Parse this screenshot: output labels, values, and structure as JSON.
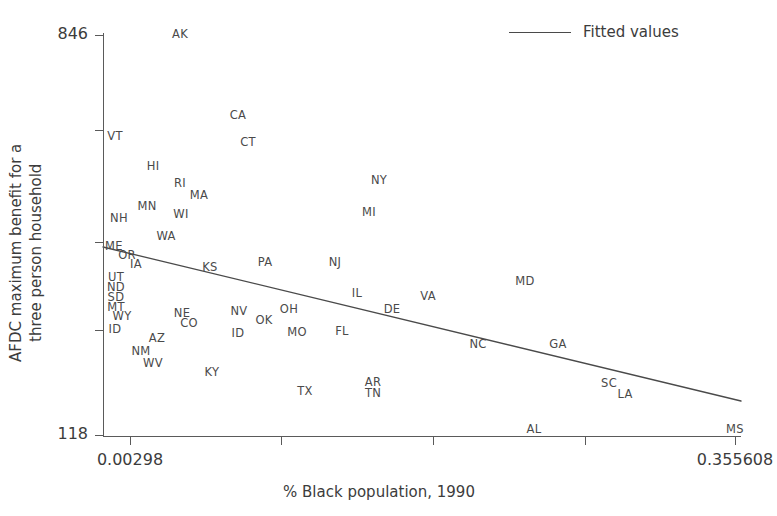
{
  "chart_data": {
    "type": "scatter",
    "title": "",
    "xlabel": "% Black population, 1990",
    "ylabel": "AFDC maximum benefit for a\nthree person household",
    "ylabel_line1": "AFDC maximum benefit for a",
    "ylabel_line2": "three person household",
    "xlim": [
      0.00298,
      0.355608
    ],
    "ylim": [
      118,
      846
    ],
    "xticks": [
      "0.00298",
      "",
      "",
      "",
      "0.355608"
    ],
    "xtick_values": [
      0.00298,
      0.09118,
      0.17929,
      0.2675,
      0.355608
    ],
    "yticks": [
      "846",
      "",
      "",
      "",
      "118"
    ],
    "ytick_values": [
      846,
      673,
      469,
      309,
      118
    ],
    "grid": false,
    "marker_style": "label-only",
    "legend": {
      "position": "top-right",
      "entries": [
        {
          "label": "Fitted values",
          "type": "line",
          "color": "#4a4a4a"
        }
      ]
    },
    "fit_line": {
      "label": "Fitted values",
      "color": "#4a4a4a",
      "x_start": 0.00298,
      "y_start": 493,
      "x_end": 0.355608,
      "y_end": 215
    },
    "point_labels": [
      "AK",
      "CA",
      "CT",
      "VT",
      "HI",
      "RI",
      "MA",
      "MN",
      "NH",
      "WI",
      "NY",
      "MI",
      "WA",
      "ME",
      "OR",
      "IA",
      "UT",
      "ND",
      "SD",
      "MT",
      "WY",
      "ID",
      "KS",
      "PA",
      "NJ",
      "MD",
      "IL",
      "VA",
      "DE",
      "NE",
      "CO",
      "NV",
      "OH",
      "OK",
      "MO",
      "FL",
      "NC",
      "GA",
      "AZ",
      "ID",
      "NM",
      "WV",
      "KY",
      "TX",
      "AR",
      "TN",
      "SC",
      "LA",
      "AL",
      "MS",
      "RI"
    ],
    "points": [
      {
        "label": "AK",
        "px": 180,
        "py": 35,
        "x": 0.0425,
        "y": 846
      },
      {
        "label": "CA",
        "px": 238,
        "py": 116,
        "x": 0.0749,
        "y": 701
      },
      {
        "label": "CT",
        "px": 248,
        "py": 143,
        "x": 0.0804,
        "y": 652
      },
      {
        "label": "VT",
        "px": 115,
        "py": 137,
        "x": 0.0065,
        "y": 663
      },
      {
        "label": "HI",
        "px": 153,
        "py": 167,
        "x": 0.0276,
        "y": 608
      },
      {
        "label": "RI",
        "px": 180,
        "py": 184,
        "x": 0.0427,
        "y": 578
      },
      {
        "label": "MA",
        "px": 199,
        "py": 196,
        "x": 0.0532,
        "y": 556
      },
      {
        "label": "MN",
        "px": 147,
        "py": 207,
        "x": 0.0243,
        "y": 536
      },
      {
        "label": "NH",
        "px": 119,
        "py": 219,
        "x": 0.0088,
        "y": 515
      },
      {
        "label": "WI",
        "px": 181,
        "py": 215,
        "x": 0.0433,
        "y": 522
      },
      {
        "label": "NY",
        "px": 379,
        "py": 181,
        "x": 0.1534,
        "y": 583
      },
      {
        "label": "MI",
        "px": 369,
        "py": 213,
        "x": 0.1478,
        "y": 526
      },
      {
        "label": "WA",
        "px": 166,
        "py": 237,
        "x": 0.0349,
        "y": 483
      },
      {
        "label": "ME",
        "px": 114,
        "py": 247,
        "x": 0.006,
        "y": 465
      },
      {
        "label": "OR",
        "px": 127,
        "py": 256,
        "x": 0.0132,
        "y": 449
      },
      {
        "label": "IA",
        "px": 136,
        "py": 265,
        "x": 0.0182,
        "y": 433
      },
      {
        "label": "UT",
        "px": 116,
        "py": 278,
        "x": 0.0071,
        "y": 409
      },
      {
        "label": "ND",
        "px": 116,
        "py": 288,
        "x": 0.0071,
        "y": 391
      },
      {
        "label": "SD",
        "px": 116,
        "py": 298,
        "x": 0.0071,
        "y": 373
      },
      {
        "label": "MT",
        "px": 116,
        "py": 308,
        "x": 0.0071,
        "y": 355
      },
      {
        "label": "WY",
        "px": 122,
        "py": 317,
        "x": 0.0104,
        "y": 338
      },
      {
        "label": "ID",
        "px": 115,
        "py": 330,
        "x": 0.0065,
        "y": 315
      },
      {
        "label": "KS",
        "px": 210,
        "py": 268,
        "x": 0.0593,
        "y": 427
      },
      {
        "label": "PA",
        "px": 265,
        "py": 263,
        "x": 0.0899,
        "y": 436
      },
      {
        "label": "NJ",
        "px": 335,
        "py": 263,
        "x": 0.1288,
        "y": 436
      },
      {
        "label": "MD",
        "px": 525,
        "py": 282,
        "x": 0.2345,
        "y": 402
      },
      {
        "label": "IL",
        "px": 357,
        "py": 294,
        "x": 0.1411,
        "y": 381
      },
      {
        "label": "VA",
        "px": 428,
        "py": 297,
        "x": 0.1805,
        "y": 375
      },
      {
        "label": "DE",
        "px": 392,
        "py": 310,
        "x": 0.1605,
        "y": 352
      },
      {
        "label": "NE",
        "px": 182,
        "py": 314,
        "x": 0.0438,
        "y": 344
      },
      {
        "label": "CO",
        "px": 189,
        "py": 324,
        "x": 0.0477,
        "y": 326
      },
      {
        "label": "NV",
        "px": 239,
        "py": 312,
        "x": 0.0755,
        "y": 348
      },
      {
        "label": "OH",
        "px": 289,
        "py": 310,
        "x": 0.1033,
        "y": 352
      },
      {
        "label": "OK",
        "px": 264,
        "py": 321,
        "x": 0.0894,
        "y": 332
      },
      {
        "label": "MO",
        "px": 297,
        "py": 333,
        "x": 0.1077,
        "y": 310
      },
      {
        "label": "FL",
        "px": 342,
        "py": 332,
        "x": 0.1327,
        "y": 312
      },
      {
        "label": "NC",
        "px": 478,
        "py": 345,
        "x": 0.2084,
        "y": 289
      },
      {
        "label": "GA",
        "px": 558,
        "py": 345,
        "x": 0.2529,
        "y": 289
      },
      {
        "label": "AZ",
        "px": 157,
        "py": 339,
        "x": 0.0299,
        "y": 300
      },
      {
        "label": "ID",
        "px": 238,
        "py": 334,
        "x": 0.0749,
        "y": 309
      },
      {
        "label": "NM",
        "px": 141,
        "py": 352,
        "x": 0.021,
        "y": 277
      },
      {
        "label": "WV",
        "px": 153,
        "py": 364,
        "x": 0.0276,
        "y": 255
      },
      {
        "label": "KY",
        "px": 212,
        "py": 373,
        "x": 0.0604,
        "y": 239
      },
      {
        "label": "TX",
        "px": 305,
        "py": 392,
        "x": 0.1122,
        "y": 205
      },
      {
        "label": "AR",
        "px": 373,
        "py": 383,
        "x": 0.15,
        "y": 221
      },
      {
        "label": "TN",
        "px": 373,
        "py": 394,
        "x": 0.15,
        "y": 201
      },
      {
        "label": "SC",
        "px": 609,
        "py": 384,
        "x": 0.2813,
        "y": 219
      },
      {
        "label": "LA",
        "px": 625,
        "py": 395,
        "x": 0.2902,
        "y": 200
      },
      {
        "label": "AL",
        "px": 534,
        "py": 430,
        "x": 0.2396,
        "y": 137
      },
      {
        "label": "MS",
        "px": 735,
        "py": 430,
        "x": 0.3514,
        "y": 137
      }
    ]
  },
  "axes": {
    "y": {
      "ticks": [
        {
          "label": "846",
          "py": 35
        },
        {
          "label": "",
          "py": 130
        },
        {
          "label": "",
          "py": 242
        },
        {
          "label": "",
          "py": 330
        },
        {
          "label": "118",
          "py": 435
        }
      ]
    },
    "x": {
      "ticks": [
        {
          "label": "0.00298",
          "px": 130
        },
        {
          "label": "",
          "px": 281
        },
        {
          "label": "",
          "px": 433
        },
        {
          "label": "",
          "px": 585
        },
        {
          "label": "0.355608",
          "px": 735
        }
      ]
    }
  },
  "legend": {
    "label": "Fitted values"
  },
  "colors": {
    "axis": "#5a5a5a",
    "text": "#3c3c3c",
    "marker_label": "#4a4a4a",
    "fit_line": "#4a4a4a",
    "background": "#ffffff"
  }
}
